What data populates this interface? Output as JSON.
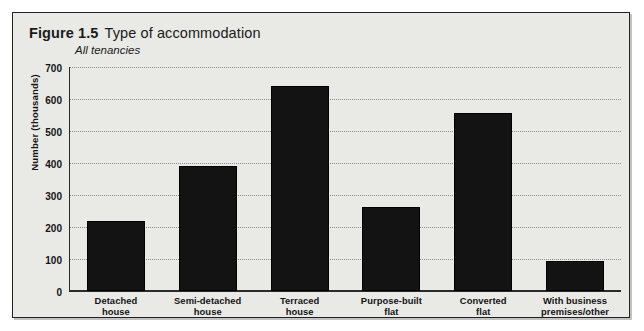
{
  "figure": {
    "number": "Figure 1.5",
    "title": "Type of accommodation",
    "subtitle": "All tenancies"
  },
  "chart_data": {
    "type": "bar",
    "title": "Type of accommodation",
    "subtitle": "All tenancies",
    "xlabel": "",
    "ylabel": "Number (thousands)",
    "categories": [
      "Detached house",
      "Semi-detached house",
      "Terraced house",
      "Purpose-built flat",
      "Converted flat",
      "With business premises/other"
    ],
    "category_lines": [
      [
        "Detached",
        "house"
      ],
      [
        "Semi-detached",
        "house"
      ],
      [
        "Terraced",
        "house"
      ],
      [
        "Purpose-built",
        "flat"
      ],
      [
        "Converted",
        "flat"
      ],
      [
        "With business",
        "premises/other"
      ]
    ],
    "values": [
      220,
      390,
      640,
      262,
      555,
      95
    ],
    "ylim": [
      0,
      700
    ],
    "yticks": [
      0,
      100,
      200,
      300,
      400,
      500,
      600,
      700
    ],
    "ytick_labels": [
      "0",
      "100",
      "200",
      "300",
      "400",
      "500",
      "600",
      "700"
    ],
    "grid": true,
    "legend": "none",
    "bar_color": "#131313"
  },
  "ticks": {
    "t0": "0",
    "t1": "100",
    "t2": "200",
    "t3": "300",
    "t4": "400",
    "t5": "500",
    "t6": "600",
    "t7": "700"
  },
  "xlabels": {
    "b0l1": "Detached",
    "b0l2": "house",
    "b1l1": "Semi-detached",
    "b1l2": "house",
    "b2l1": "Terraced",
    "b2l2": "house",
    "b3l1": "Purpose-built",
    "b3l2": "flat",
    "b4l1": "Converted",
    "b4l2": "flat",
    "b5l1": "With business",
    "b5l2": "premises/other"
  }
}
